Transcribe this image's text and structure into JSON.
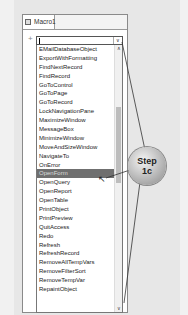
{
  "window": {
    "tab_label": "Macro1",
    "tab_icon": "macro-icon"
  },
  "combo": {
    "value": "",
    "expander_glyph": "+",
    "arrow_glyph": "∨"
  },
  "list": {
    "items": [
      "EMailDatabaseObject",
      "ExportWithFormatting",
      "FindNextRecord",
      "FindRecord",
      "GoToControl",
      "GoToPage",
      "GoToRecord",
      "LockNavigationPane",
      "MaximizeWindow",
      "MessageBox",
      "MinimizeWindow",
      "MoveAndSizeWindow",
      "NavigateTo",
      "OnError",
      "OpenForm",
      "OpenQuery",
      "OpenReport",
      "OpenTable",
      "PrintObject",
      "PrintPreview",
      "QuitAccess",
      "Redo",
      "Refresh",
      "RefreshRecord",
      "RemoveAllTempVars",
      "RemoveFilterSort",
      "RemoveTempVar",
      "RepaintObject"
    ],
    "selected": "OpenForm",
    "scroll_up_glyph": "∧",
    "scroll_down_glyph": "∨"
  },
  "callout": {
    "line1": "Step",
    "line2": "1c"
  },
  "cursor_glyph": "↖"
}
